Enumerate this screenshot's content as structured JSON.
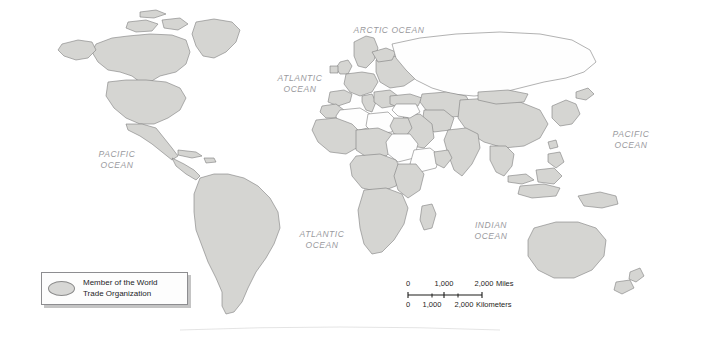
{
  "map": {
    "title": "World map of World Trade Organization members",
    "projection": "world-robinson",
    "background_color": "#ffffff",
    "member_fill": "#d5d5d2",
    "nonmember_fill": "#fefefe",
    "border_color": "#6f6f6f",
    "coastline_color": "#8b8b8b"
  },
  "ocean_labels": [
    {
      "name": "arctic-ocean",
      "text": "ARCTIC OCEAN",
      "x": 389,
      "y": 30
    },
    {
      "name": "atlantic-ocean-north",
      "text": "ATLANTIC\nOCEAN",
      "x": 300,
      "y": 84
    },
    {
      "name": "atlantic-ocean-south",
      "text": "ATLANTIC\nOCEAN",
      "x": 322,
      "y": 240
    },
    {
      "name": "pacific-ocean-west",
      "text": "PACIFIC\nOCEAN",
      "x": 117,
      "y": 160
    },
    {
      "name": "pacific-ocean-east",
      "text": "PACIFIC\nOCEAN",
      "x": 631,
      "y": 140
    },
    {
      "name": "indian-ocean",
      "text": "INDIAN\nOCEAN",
      "x": 491,
      "y": 231
    }
  ],
  "legend": {
    "swatch_shape": "ellipse",
    "swatch_fill": "#d7d7d5",
    "label": "Member of the World\nTrade Organization"
  },
  "scale_bar": {
    "miles": {
      "ticks": [
        "0",
        "1,000",
        "2,000"
      ],
      "unit": "Miles"
    },
    "kilometers": {
      "ticks": [
        "0",
        "1,000",
        "2,000"
      ],
      "unit": "Kilometers"
    }
  }
}
